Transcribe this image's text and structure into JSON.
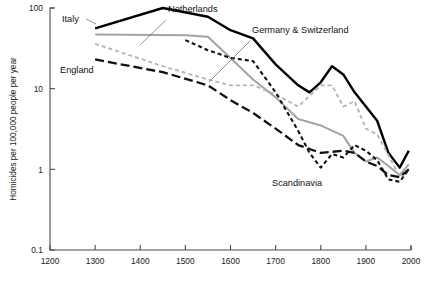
{
  "chart_data": {
    "type": "line",
    "title": "",
    "xlabel": "",
    "ylabel": "Homicides per 100,000 people per year",
    "xlim": [
      1200,
      2000
    ],
    "ylim": [
      0.1,
      100
    ],
    "yscale": "log",
    "grid": false,
    "legend_position": "inline-annotations",
    "x_ticks": [
      "1200",
      "1300",
      "1400",
      "1500",
      "1600",
      "1700",
      "1800",
      "1900",
      "2000"
    ],
    "y_ticks": [
      "100",
      "10",
      "1",
      "0.1"
    ],
    "series": [
      {
        "name": "Italy",
        "style": "solid",
        "color": "#000000",
        "width": 2.4,
        "label_x": 62,
        "label_y": 22,
        "points": [
          [
            1300,
            56
          ],
          [
            1450,
            100
          ],
          [
            1550,
            78
          ],
          [
            1600,
            53
          ],
          [
            1650,
            42
          ],
          [
            1700,
            20
          ],
          [
            1750,
            11
          ],
          [
            1775,
            9.0
          ],
          [
            1800,
            12
          ],
          [
            1825,
            19
          ],
          [
            1850,
            15
          ],
          [
            1875,
            9.0
          ],
          [
            1900,
            6.0
          ],
          [
            1925,
            4.0
          ],
          [
            1950,
            1.6
          ],
          [
            1975,
            1.05
          ],
          [
            1995,
            1.7
          ]
        ]
      },
      {
        "name": "Netherlands",
        "style": "solid",
        "color": "#a3a3a3",
        "width": 2.0,
        "label_x": 168,
        "label_y": 12,
        "points": [
          [
            1300,
            47
          ],
          [
            1500,
            46
          ],
          [
            1550,
            44
          ],
          [
            1600,
            24
          ],
          [
            1650,
            13
          ],
          [
            1700,
            7.8
          ],
          [
            1750,
            4.2
          ],
          [
            1800,
            3.5
          ],
          [
            1850,
            2.6
          ],
          [
            1875,
            1.6
          ],
          [
            1900,
            1.25
          ],
          [
            1925,
            1.4
          ],
          [
            1950,
            1.1
          ],
          [
            1975,
            0.85
          ],
          [
            1995,
            1.15
          ]
        ]
      },
      {
        "name": "Germany & Switzerland",
        "style": "dashed-light",
        "color": "#b5b5b5",
        "width": 1.9,
        "label_x": 252,
        "label_y": 33,
        "points": [
          [
            1300,
            36
          ],
          [
            1450,
            19
          ],
          [
            1550,
            13
          ],
          [
            1600,
            11
          ],
          [
            1650,
            11
          ],
          [
            1700,
            8.5
          ],
          [
            1750,
            6.0
          ],
          [
            1800,
            11
          ],
          [
            1825,
            11
          ],
          [
            1850,
            6.0
          ],
          [
            1875,
            7.0
          ],
          [
            1900,
            3.2
          ],
          [
            1925,
            2.7
          ],
          [
            1950,
            1.5
          ],
          [
            1975,
            0.8
          ],
          [
            1995,
            1.0
          ]
        ]
      },
      {
        "name": "England",
        "style": "long-dash",
        "color": "#111111",
        "width": 2.3,
        "label_x": 60,
        "label_y": 73,
        "points": [
          [
            1300,
            23
          ],
          [
            1450,
            16
          ],
          [
            1550,
            11
          ],
          [
            1600,
            7.2
          ],
          [
            1650,
            5.0
          ],
          [
            1700,
            3.2
          ],
          [
            1750,
            2.0
          ],
          [
            1800,
            1.6
          ],
          [
            1850,
            1.7
          ],
          [
            1875,
            1.6
          ],
          [
            1900,
            1.25
          ],
          [
            1925,
            1.1
          ],
          [
            1950,
            0.85
          ],
          [
            1975,
            0.8
          ],
          [
            1995,
            1.0
          ]
        ]
      },
      {
        "name": "Scandinavia",
        "style": "short-dash",
        "color": "#111111",
        "width": 2.1,
        "label_x": 272,
        "label_y": 186,
        "points": [
          [
            1500,
            40
          ],
          [
            1550,
            30
          ],
          [
            1600,
            24
          ],
          [
            1625,
            23
          ],
          [
            1650,
            22
          ],
          [
            1700,
            9.0
          ],
          [
            1750,
            3.0
          ],
          [
            1775,
            1.6
          ],
          [
            1800,
            1.05
          ],
          [
            1825,
            1.55
          ],
          [
            1850,
            1.4
          ],
          [
            1875,
            2.0
          ],
          [
            1900,
            1.7
          ],
          [
            1925,
            1.3
          ],
          [
            1950,
            0.75
          ],
          [
            1975,
            0.7
          ],
          [
            1995,
            1.0
          ]
        ]
      }
    ],
    "annotations": [
      {
        "name": "Italy",
        "leader": false
      },
      {
        "name": "Netherlands",
        "leader": true
      },
      {
        "name": "Germany & Switzerland",
        "leader": true
      },
      {
        "name": "England",
        "leader": false
      },
      {
        "name": "Scandinavia",
        "leader": false
      }
    ]
  }
}
